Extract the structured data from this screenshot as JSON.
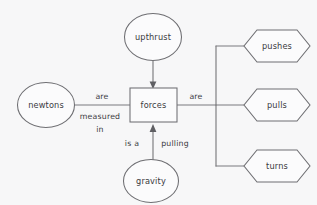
{
  "diagram": {
    "background_color": "#f7f7f8",
    "stroke_color": "#6e6e72",
    "text_color": "#3a3a3e",
    "nodes": {
      "center": {
        "label": "forces",
        "shape": "rectangle"
      },
      "upthrust": {
        "label": "upthrust",
        "shape": "ellipse"
      },
      "newtons": {
        "label": "newtons",
        "shape": "ellipse"
      },
      "gravity": {
        "label": "gravity",
        "shape": "ellipse"
      },
      "pushes": {
        "label": "pushes",
        "shape": "hexagon"
      },
      "pulls": {
        "label": "pulls",
        "shape": "hexagon"
      },
      "turns": {
        "label": "turns",
        "shape": "hexagon"
      }
    },
    "edge_labels": {
      "are": "are",
      "measured": "measured",
      "in": "in",
      "are_right": "are",
      "is_a": "is a",
      "pulling": "pulling"
    }
  }
}
